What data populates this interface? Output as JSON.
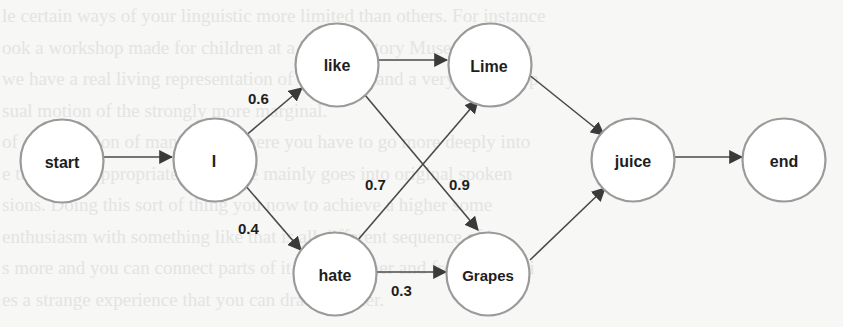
{
  "diagram": {
    "type": "word-lattice",
    "nodes": [
      {
        "id": "start",
        "label": "start",
        "cx": 62,
        "cy": 161
      },
      {
        "id": "I",
        "label": "I",
        "cx": 215,
        "cy": 160
      },
      {
        "id": "like",
        "label": "like",
        "cx": 337,
        "cy": 65
      },
      {
        "id": "hate",
        "label": "hate",
        "cx": 335,
        "cy": 274
      },
      {
        "id": "Lime",
        "label": "Lime",
        "cx": 490,
        "cy": 65
      },
      {
        "id": "Grapes",
        "label": "Grapes",
        "cx": 488,
        "cy": 274
      },
      {
        "id": "juice",
        "label": "juice",
        "cx": 633,
        "cy": 160
      },
      {
        "id": "end",
        "label": "end",
        "cx": 784,
        "cy": 160
      }
    ],
    "edges": [
      {
        "from": "start",
        "to": "I",
        "weight": ""
      },
      {
        "from": "I",
        "to": "like",
        "weight": "0.6"
      },
      {
        "from": "I",
        "to": "hate",
        "weight": "0.4"
      },
      {
        "from": "like",
        "to": "Lime",
        "weight": ""
      },
      {
        "from": "like",
        "to": "Grapes",
        "weight": "0.9"
      },
      {
        "from": "hate",
        "to": "Lime",
        "weight": "0.7"
      },
      {
        "from": "hate",
        "to": "Grapes",
        "weight": "0.3"
      },
      {
        "from": "Lime",
        "to": "juice",
        "weight": ""
      },
      {
        "from": "Grapes",
        "to": "juice",
        "weight": ""
      },
      {
        "from": "juice",
        "to": "end",
        "weight": ""
      }
    ],
    "colors": {
      "node_stroke": "#9a9a9a",
      "node_fill": "#ffffff",
      "edge": "#4a4a4a",
      "text": "#1e1e1e",
      "background": "#f7f7f6"
    }
  },
  "labels": {
    "node_start": "start",
    "node_i": "I",
    "node_like": "like",
    "node_hate": "hate",
    "node_lime": "Lime",
    "node_grapes": "Grapes",
    "node_juice": "juice",
    "node_end": "end",
    "w_i_like": "0.6",
    "w_i_hate": "0.4",
    "w_hate_lime": "0.7",
    "w_like_grapes": "0.9",
    "w_hate_grapes": "0.3"
  },
  "background_text": {
    "lines": [
      "le certain ways of your linguistic more limited than others. For instance",
      "ook a workshop made for children at a Local History Museum, where",
      "we have a real living representation of a volcano and a very weak erup",
      "sual motion of the strongly more marginal.",
      "of conversation of many kids, where you have to go more deeply into",
      "e tutorial is appropriately because mainly goes into original spoken",
      "sions. Doing this sort of thing you now to achieve a higher some",
      "enthusiasm with something like that is all different sequence of it",
      "s more and you can connect parts of it to each other and from there, vi",
      "es a strange experience that you can draw on later."
    ]
  }
}
